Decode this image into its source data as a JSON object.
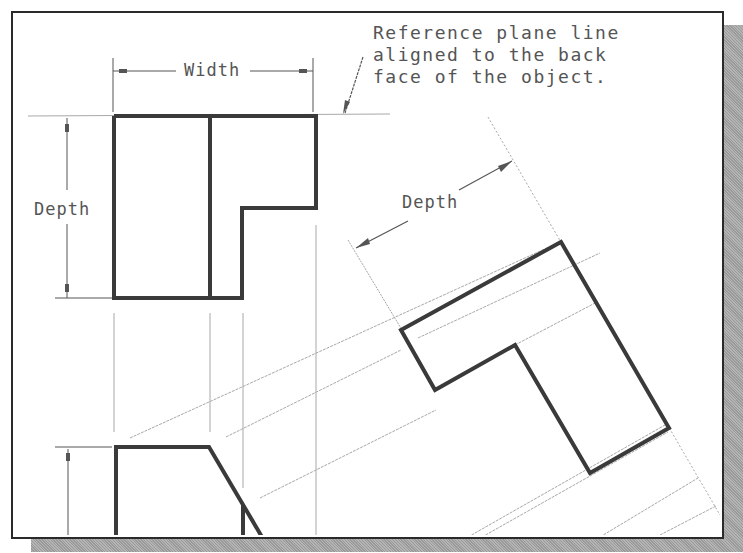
{
  "figure": {
    "type": "auxiliary-view-construction",
    "labels": {
      "width": "Width",
      "depth_top_view": "Depth",
      "depth_auxiliary": "Depth"
    },
    "note": {
      "lines": [
        "Reference plane line",
        "aligned to the back",
        "face of the object."
      ]
    },
    "colors": {
      "object_line": "#3a3a3a",
      "construction_line": "#a8a8a8",
      "text": "#555555",
      "frame": "#2a2a2a",
      "shadow": "#a6a6a6"
    }
  }
}
